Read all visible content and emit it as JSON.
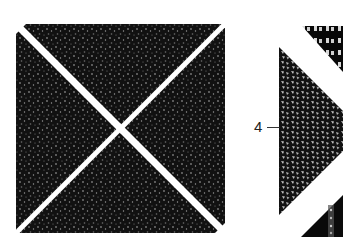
{
  "figure": {
    "panels": [
      {
        "id": "left-square",
        "description": "Square sample with granular texture divided by a white X into four triangles",
        "bounds": {
          "x": 16,
          "y": 24,
          "width": 209,
          "height": 209
        },
        "x_center": {
          "x": 121,
          "y": 128
        },
        "texture_color": "#111111",
        "grain_color": "#8a8a8a",
        "gap_color": "#ffffff"
      },
      {
        "id": "right-panel",
        "description": "Cropped triangular section with coarser grains, labeled 4",
        "label": "4",
        "triangle_apex_left": {
          "x": 279,
          "top_y": 47,
          "bottom_y": 215
        },
        "texture_color": "#111111",
        "grain_color": "#bdbdbd"
      }
    ],
    "callout_label": "4",
    "colors": {
      "background": "#ffffff",
      "dark_texture": "#111111",
      "label_text": "#222222"
    }
  }
}
